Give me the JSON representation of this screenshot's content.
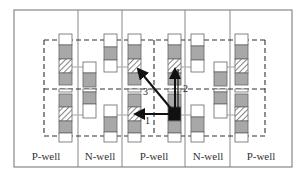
{
  "diagram": {
    "type": "layout-schematic",
    "wells": [
      {
        "label": "P-well",
        "x0": 14,
        "x1": 78
      },
      {
        "label": "N-well",
        "x0": 78,
        "x1": 122
      },
      {
        "label": "P-well",
        "x0": 122,
        "x1": 185
      },
      {
        "label": "N-well",
        "x0": 185,
        "x1": 230
      },
      {
        "label": "P-well",
        "x0": 230,
        "x1": 292
      }
    ],
    "arrows": [
      {
        "label": "1",
        "direction": "horizontal-left"
      },
      {
        "label": "2",
        "direction": "vertical-up"
      },
      {
        "label": "3",
        "direction": "diagonal-up-left"
      }
    ],
    "legend_note": "hatched cells = neighboring victim cells; dark cell = aggressor",
    "colors": {
      "frame": "#888888",
      "fill_gray": "#a8a8a8",
      "arrow": "#111111",
      "connector": "#b0b0b0",
      "dash": "#333333"
    }
  }
}
